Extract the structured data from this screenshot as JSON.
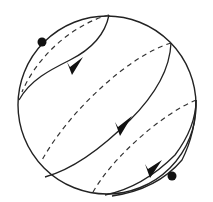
{
  "diagram": {
    "type": "sphere-flow-lines",
    "colors": {
      "stroke": "#222222",
      "background": "#ffffff",
      "dot": "#111111"
    },
    "sphere": {
      "cx": 107,
      "cy": 105,
      "r": 89
    },
    "points": [
      {
        "name": "upper-left-point",
        "x": 42,
        "y": 42
      },
      {
        "name": "lower-right-point",
        "x": 172,
        "y": 176
      }
    ],
    "arrows": [
      {
        "name": "upper-arrow",
        "x": 73,
        "y": 70,
        "angle": -45
      },
      {
        "name": "middle-arrow",
        "x": 120,
        "y": 132,
        "angle": -48
      },
      {
        "name": "lower-arrow",
        "x": 152,
        "y": 172,
        "angle": -40
      }
    ]
  }
}
